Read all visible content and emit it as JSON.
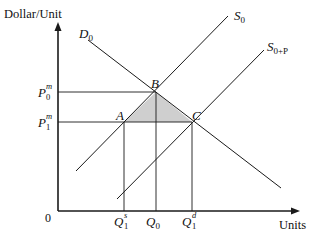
{
  "axes": {
    "y_title": "Dollar/Unit",
    "x_title": "Units",
    "origin_label": "0"
  },
  "curves": {
    "demand": {
      "label": "D",
      "sub": "0"
    },
    "supply": {
      "label": "S",
      "sub": "0"
    },
    "supply_shifted": {
      "label": "S",
      "sub": "0+P"
    }
  },
  "price_labels": {
    "p0": {
      "label": "P",
      "sub": "0",
      "sup": "m"
    },
    "p1": {
      "label": "P",
      "sub": "1",
      "sup": "m"
    }
  },
  "quantity_labels": {
    "q1s": {
      "label": "Q",
      "sub": "1",
      "sup": "s"
    },
    "q0": {
      "label": "Q",
      "sub": "0"
    },
    "q1d": {
      "label": "Q",
      "sub": "1",
      "sup": "d"
    }
  },
  "points": {
    "a": "A",
    "b": "B",
    "c": "C"
  },
  "colors": {
    "line": "#1a1a1a",
    "shade": "#cfcfcf",
    "background": "#ffffff"
  }
}
